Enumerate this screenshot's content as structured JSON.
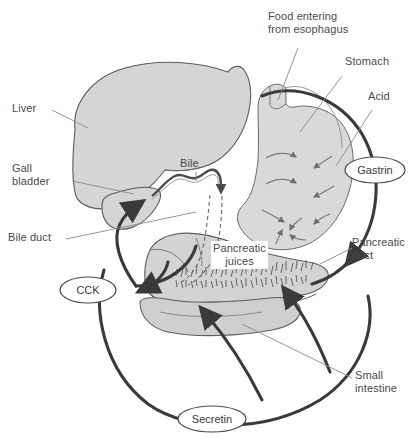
{
  "figure": {
    "background_color": "#ffffff",
    "organ_fill": "#d5d5d5",
    "organ_stroke": "#5a5a5a",
    "label_color": "#4a4a4a",
    "thick_path_color": "#3a3a3a"
  },
  "labels": {
    "liver": "Liver",
    "gall_bladder": "Gall\nbladder",
    "bile_duct": "Bile duct",
    "bile": "Bile",
    "food_entering": "Food entering\nfrom esophagus",
    "stomach": "Stomach",
    "acid": "Acid",
    "pancreatic_duct": "Pancreatic\nduct",
    "pancreatic_juices": "Pancreatic\njuices",
    "small_intestine": "Small\nintestine"
  },
  "hormones": [
    {
      "name": "CCK",
      "label": "CCK"
    },
    {
      "name": "Gastrin",
      "label": "Gastrin"
    },
    {
      "name": "Secretin",
      "label": "Secretin"
    }
  ]
}
